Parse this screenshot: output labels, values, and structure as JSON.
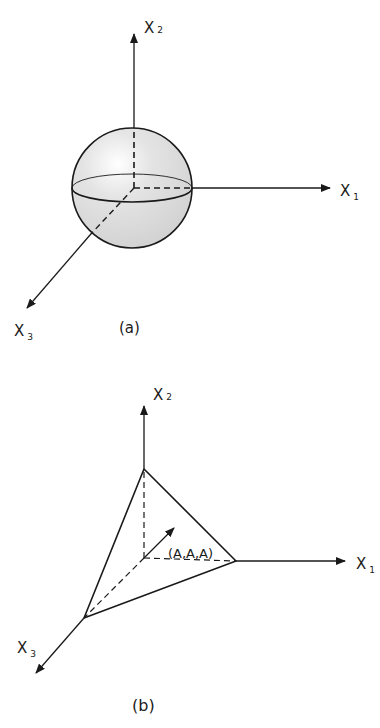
{
  "figure_a": {
    "caption": "(a)",
    "axes": {
      "x1": {
        "label": "X",
        "sub": "1"
      },
      "x2": {
        "label": "X",
        "sub": "2"
      },
      "x3": {
        "label": "X",
        "sub": "3"
      }
    },
    "shape": "sphere"
  },
  "figure_b": {
    "caption": "(b)",
    "axes": {
      "x1": {
        "label": "X",
        "sub": "1"
      },
      "x2": {
        "label": "X",
        "sub": "2"
      },
      "x3": {
        "label": "X",
        "sub": "3"
      }
    },
    "shape": "tetrahedron",
    "vector_label": "(A,A,A)"
  },
  "colors": {
    "ink": "#1a1a1a",
    "shade": "#d9d9d9"
  }
}
